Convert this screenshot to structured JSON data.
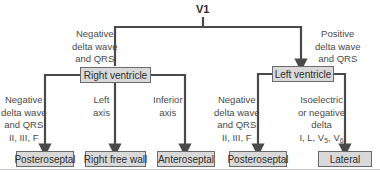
{
  "diagram": {
    "root": "V1",
    "colors": {
      "line": "#4a4a4a",
      "box_fill": "#d9d9d9",
      "box_border": "#6b6b6b",
      "text": "#3a3a3a"
    },
    "branches": {
      "left_condition": [
        "Negative",
        "delta wave",
        "and QRS"
      ],
      "right_condition": [
        "Positive",
        "delta wave",
        "and QRS"
      ]
    },
    "nodes": {
      "right_ventricle": "Right ventricle",
      "left_ventricle": "Left ventricle"
    },
    "right_ventricle_children": [
      {
        "condition": [
          "Negative",
          "delta wave",
          "and QRS",
          "II, III, F"
        ],
        "result": "Posteroseptal"
      },
      {
        "condition": [
          "Left",
          "axis"
        ],
        "result": "Right free wall"
      },
      {
        "condition": [
          "Inferior",
          "axis"
        ],
        "result": "Anteroseptal"
      }
    ],
    "left_ventricle_children": [
      {
        "condition": [
          "Negative",
          "delta wave",
          "and QRS",
          "II, III, F"
        ],
        "result": "Posteroseptal"
      },
      {
        "condition": [
          "Isoelectric",
          "or negative",
          "delta"
        ],
        "leads": {
          "prefix": "I, L, V",
          "sub1": "5",
          "mid": ", V",
          "sub2": "6"
        },
        "result": "Lateral"
      }
    ]
  }
}
